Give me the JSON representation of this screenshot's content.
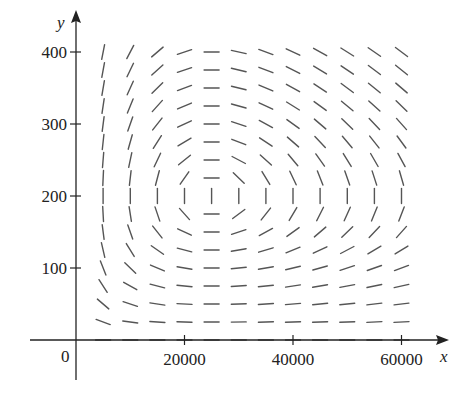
{
  "chart_data": {
    "type": "direction_field",
    "title": "",
    "xlabel": "x",
    "ylabel": "y",
    "origin_label": "0",
    "xlim": [
      0,
      64000
    ],
    "ylim": [
      0,
      420
    ],
    "x_ticks": [
      20000,
      40000,
      60000
    ],
    "x_tick_labels": [
      "20000",
      "40000",
      "60000"
    ],
    "y_ticks": [
      100,
      200,
      300,
      400
    ],
    "y_tick_labels": [
      "100",
      "200",
      "300",
      "400"
    ],
    "grid": false,
    "legend": null,
    "field": {
      "description": "Predator-prey phase-plane direction field, slope dy/dx = y(-c + d x) / (x(a - b y))",
      "equilibrium": {
        "x": 25000,
        "y": 200
      },
      "params": {
        "a": 0.08,
        "b": 0.0004,
        "c": 0.048,
        "d": 1.92e-06
      },
      "x_samples": [
        5000,
        10000,
        15000,
        20000,
        25000,
        30000,
        35000,
        40000,
        45000,
        50000,
        55000,
        60000
      ],
      "y_samples": [
        0,
        25,
        50,
        75,
        100,
        125,
        150,
        175,
        200,
        225,
        250,
        275,
        300,
        325,
        350,
        375,
        400
      ]
    }
  },
  "colors": {
    "axis": "#222222",
    "segment": "#555555"
  }
}
